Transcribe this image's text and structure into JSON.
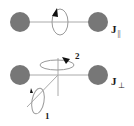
{
  "diagram": {
    "colors": {
      "atom": "#777777",
      "line": "#aaaaaa",
      "loop": "#999999",
      "arrow": "#111111",
      "text": "#1a1a1a"
    },
    "top_panel": {
      "label_main": "J",
      "label_sub": "||",
      "description": "rotation about the bond axis (parallel)"
    },
    "bottom_panel": {
      "label_main": "J",
      "label_sub": "⊥",
      "description": "rotations about axes perpendicular to the bond",
      "axis_labels": [
        "1",
        "2"
      ]
    }
  }
}
